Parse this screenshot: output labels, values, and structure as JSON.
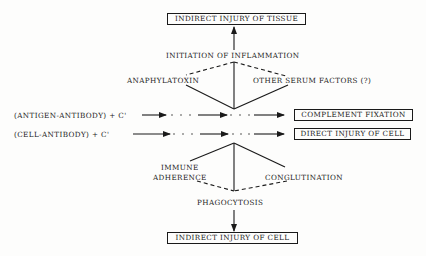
{
  "diagram": {
    "outcomes": {
      "indirect_tissue": "INDIRECT INJURY OF TISSUE",
      "complement_fixation": "COMPLEMENT FIXATION",
      "direct_cell": "DIRECT INJURY OF CELL",
      "indirect_cell": "INDIRECT INJURY OF CELL"
    },
    "inputs": {
      "antigen_antibody": "(ANTIGEN-ANTIBODY) + C'",
      "cell_antibody": "(CELL-ANTIBODY) + C'"
    },
    "upper": {
      "initiation": "INITIATION OF INFLAMMATION",
      "anaphylatoxin": "ANAPHYLATOXIN",
      "other_factors": "OTHER SERUM FACTORS (?)"
    },
    "lower": {
      "immune": "IMMUNE",
      "adherence": "ADHERENCE",
      "conglutination": "CONGLUTINATION",
      "phagocytosis": "PHAGOCYTOSIS"
    },
    "colors": {
      "ink": "#1a1a1a",
      "paper": "#fdfdfc"
    }
  }
}
